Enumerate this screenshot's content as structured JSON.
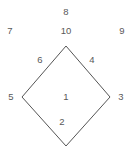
{
  "diagram": {
    "type": "rhombus-labeled-diagram",
    "canvas": {
      "width": 132,
      "height": 147,
      "background": "#ffffff"
    },
    "shape": {
      "name": "rhombus",
      "stroke_color": "#555555",
      "stroke_width": 1,
      "fill": "none",
      "vertices": [
        {
          "name": "top",
          "x": 66,
          "y": 46
        },
        {
          "name": "right",
          "x": 110,
          "y": 97
        },
        {
          "name": "bottom",
          "x": 66,
          "y": 146
        },
        {
          "name": "left",
          "x": 22,
          "y": 97
        }
      ]
    },
    "labels": [
      {
        "id": "label-8",
        "text": "8",
        "x": 66,
        "y": 12,
        "role": "outer-top"
      },
      {
        "id": "label-7",
        "text": "7",
        "x": 10,
        "y": 31,
        "role": "outer-top-left"
      },
      {
        "id": "label-10",
        "text": "10",
        "x": 66,
        "y": 31,
        "role": "outer-top-center"
      },
      {
        "id": "label-9",
        "text": "9",
        "x": 122,
        "y": 31,
        "role": "outer-top-right"
      },
      {
        "id": "label-6",
        "text": "6",
        "x": 40,
        "y": 60,
        "role": "edge-upper-left"
      },
      {
        "id": "label-4",
        "text": "4",
        "x": 92,
        "y": 60,
        "role": "edge-upper-right"
      },
      {
        "id": "label-5",
        "text": "5",
        "x": 11,
        "y": 97,
        "role": "vertex-left"
      },
      {
        "id": "label-1",
        "text": "1",
        "x": 66,
        "y": 97,
        "role": "face-interior"
      },
      {
        "id": "label-3",
        "text": "3",
        "x": 121,
        "y": 97,
        "role": "vertex-right"
      },
      {
        "id": "label-2",
        "text": "2",
        "x": 62,
        "y": 122,
        "role": "edge-lower-left"
      }
    ]
  }
}
